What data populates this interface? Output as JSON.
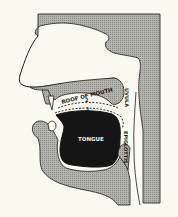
{
  "diagram": {
    "type": "anatomical cross-section",
    "labels": {
      "roof_of_mouth": "ROOF OF MOUTH",
      "uvula": "UVULA",
      "tongue": "TONGUE",
      "epiglottis": "EPIGLOTTIS",
      "position_1": "1",
      "position_2": "2"
    },
    "colors": {
      "background": "#fbfaf0",
      "tissue_shade": "#a8a8a0",
      "tongue": "#151515",
      "outline": "#1a1a1a"
    }
  }
}
